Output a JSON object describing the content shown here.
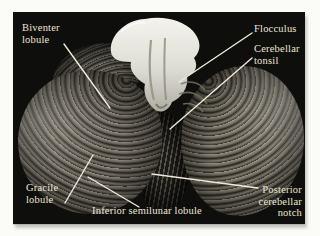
{
  "figure": {
    "labels": {
      "biventer": {
        "text": "Biventer\nlobule"
      },
      "flocculus": {
        "text": "Flocculus"
      },
      "cerebellar_tonsil": {
        "text": "Cerebellar\ntonsil"
      },
      "gracile": {
        "text": "Gracile\nlobule"
      },
      "inferior_semilunar": {
        "text": "Inferior semilunar lobule"
      },
      "posterior_notch": {
        "text": "Posterior\ncerebellar\nnotch"
      }
    },
    "colors": {
      "page_background": "#fbfbf8",
      "photo_background": "#0e0e0c",
      "label_text": "#ece6d3",
      "leader_line": "#f0ead9"
    }
  }
}
